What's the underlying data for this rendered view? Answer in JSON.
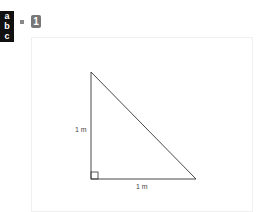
{
  "badge": {
    "letters": [
      "a",
      "b",
      "c"
    ]
  },
  "question": {
    "number": "1"
  },
  "diagram": {
    "type": "right-triangle",
    "vertical_leg_label": "1 m",
    "horizontal_leg_label": "1 m",
    "right_angle_marker": true,
    "stroke_color": "#333333"
  }
}
